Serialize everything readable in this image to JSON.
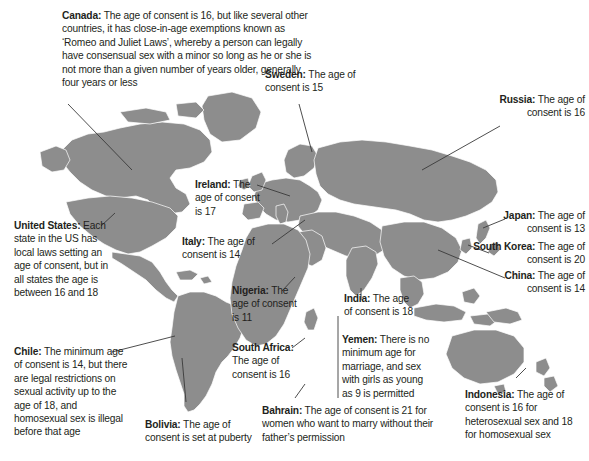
{
  "map": {
    "title": "World map of ages of consent",
    "land_color": "#8d8d8d",
    "border_color": "#ffffff",
    "ocean_color": "#ffffff",
    "text_color": "#231f20",
    "leader_line_color": "#3a3a3a"
  },
  "annotations": [
    {
      "id": "canada",
      "country": "Canada:",
      "text": " The age of consent is 16, but like several other countries, it has close-in-age exemptions known as ‘Romeo and Juliet Laws’, whereby a person can legally have consensual sex with a minor so long as he or she is not more than a given number of years older, generally four years or less"
    },
    {
      "id": "sweden",
      "country": "Sweden:",
      "text": " The age of consent is 15"
    },
    {
      "id": "russia",
      "country": "Russia:",
      "text": " The age of consent is 16"
    },
    {
      "id": "ireland",
      "country": "Ireland:",
      "text": " The age of consent is 17"
    },
    {
      "id": "united-states",
      "country": "United States:",
      "text": " Each state in the US has local laws setting an age of consent, but in all states the age is between 16 and 18"
    },
    {
      "id": "italy",
      "country": "Italy:",
      "text": " The age of consent is 14"
    },
    {
      "id": "japan",
      "country": "Japan:",
      "text": " The age of consent is 13"
    },
    {
      "id": "south-korea",
      "country": "South Korea:",
      "text": " The age of consent is 20"
    },
    {
      "id": "china",
      "country": "China:",
      "text": " The age of consent is 14"
    },
    {
      "id": "nigeria",
      "country": "Nigeria:",
      "text": " The age of consent is 11"
    },
    {
      "id": "india",
      "country": "India:",
      "text": " The age of consent is 18"
    },
    {
      "id": "chile",
      "country": "Chile:",
      "text": " The minimum age of consent is 14, but there are legal restrictions on sexual activity up to the age of 18, and homosexual sex is illegal before that age"
    },
    {
      "id": "south-africa",
      "country": "South Africa:",
      "text": " The age of consent is 16"
    },
    {
      "id": "yemen",
      "country": "Yemen:",
      "text": " There is no minimum age for marriage, and sex with girls as young as 9 is permitted"
    },
    {
      "id": "indonesia",
      "country": "Indonesia:",
      "text": " The age of consent is 16 for heterosexual sex and 18 for homosexual sex"
    },
    {
      "id": "bolivia",
      "country": "Bolivia:",
      "text": " The age of consent is set at puberty"
    },
    {
      "id": "bahrain",
      "country": "Bahrain:",
      "text": " The age of consent is 21 for women who want to marry without their father’s permission"
    }
  ]
}
